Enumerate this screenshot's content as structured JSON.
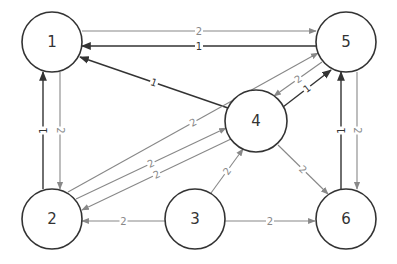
{
  "diagram": {
    "type": "directed-weighted-graph",
    "colors": {
      "weight1_edge": "#333333",
      "weight2_edge": "#888888",
      "node_stroke": "#333333",
      "background": "#ffffff"
    },
    "nodes": [
      {
        "id": "1",
        "label": "1",
        "cx": 52,
        "cy": 42,
        "r": 30
      },
      {
        "id": "2",
        "label": "2",
        "cx": 52,
        "cy": 219,
        "r": 30
      },
      {
        "id": "3",
        "label": "3",
        "cx": 195,
        "cy": 219,
        "r": 30
      },
      {
        "id": "4",
        "label": "4",
        "cx": 256,
        "cy": 121,
        "r": 31
      },
      {
        "id": "5",
        "label": "5",
        "cx": 346,
        "cy": 42,
        "r": 30
      },
      {
        "id": "6",
        "label": "6",
        "cx": 346,
        "cy": 219,
        "r": 30
      }
    ],
    "edges": [
      {
        "from": "1",
        "to": "5",
        "weight": "2",
        "x1": 82,
        "y1": 31,
        "x2": 316,
        "y2": 31
      },
      {
        "from": "5",
        "to": "1",
        "weight": "1",
        "x1": 316,
        "y1": 46,
        "x2": 82,
        "y2": 46
      },
      {
        "from": "4",
        "to": "1",
        "weight": "1",
        "x1": 228,
        "y1": 108,
        "x2": 80,
        "y2": 57
      },
      {
        "from": "2",
        "to": "5",
        "weight": "2",
        "x1": 68,
        "y1": 192,
        "x2": 318,
        "y2": 53
      },
      {
        "from": "5",
        "to": "4",
        "weight": "2",
        "x1": 322,
        "y1": 62,
        "x2": 274,
        "y2": 96
      },
      {
        "from": "4",
        "to": "5",
        "weight": "1",
        "x1": 283,
        "y1": 107,
        "x2": 331,
        "y2": 70
      },
      {
        "from": "2",
        "to": "4",
        "weight": "2",
        "x1": 76,
        "y1": 199,
        "x2": 226,
        "y2": 128
      },
      {
        "from": "4",
        "to": "2",
        "weight": "2",
        "x1": 231,
        "y1": 139,
        "x2": 82,
        "y2": 210
      },
      {
        "from": "2",
        "to": "1",
        "weight": "1",
        "x1": 43,
        "y1": 189,
        "x2": 43,
        "y2": 72
      },
      {
        "from": "1",
        "to": "2",
        "weight": "2",
        "x1": 60,
        "y1": 72,
        "x2": 60,
        "y2": 189
      },
      {
        "from": "3",
        "to": "2",
        "weight": "2",
        "x1": 165,
        "y1": 221,
        "x2": 82,
        "y2": 221
      },
      {
        "from": "3",
        "to": "4",
        "weight": "2",
        "x1": 211,
        "y1": 193,
        "x2": 243,
        "y2": 149
      },
      {
        "from": "3",
        "to": "6",
        "weight": "2",
        "x1": 225,
        "y1": 221,
        "x2": 315,
        "y2": 221
      },
      {
        "from": "4",
        "to": "6",
        "weight": "2",
        "x1": 278,
        "y1": 145,
        "x2": 328,
        "y2": 194
      },
      {
        "from": "6",
        "to": "5",
        "weight": "1",
        "x1": 341,
        "y1": 189,
        "x2": 341,
        "y2": 72
      },
      {
        "from": "5",
        "to": "6",
        "weight": "2",
        "x1": 357,
        "y1": 72,
        "x2": 357,
        "y2": 189
      }
    ]
  }
}
